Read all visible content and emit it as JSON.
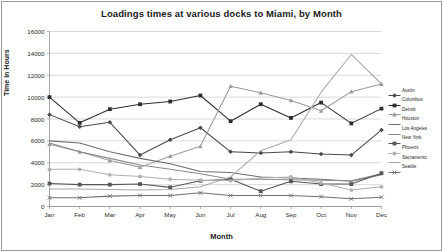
{
  "chart_data": {
    "type": "line",
    "title": "Loadings times at various docks to Miami, by Month",
    "xlabel": "Month",
    "ylabel": "Time in Hours",
    "categories": [
      "Jan",
      "Feb",
      "Mar",
      "Apr",
      "May",
      "Jun",
      "Jul",
      "Aug",
      "Sep",
      "Oct",
      "Nov",
      "Dec"
    ],
    "ylim": [
      0,
      16000
    ],
    "ytick_labels": [
      "0",
      "2000",
      "4000",
      "6000",
      "8000",
      "10000",
      "12000",
      "14000",
      "16000"
    ],
    "ytick_values": [
      0,
      2000,
      4000,
      6000,
      8000,
      10000,
      12000,
      14000,
      16000
    ],
    "grid": "horizontal",
    "legend_position": "right",
    "series": [
      {
        "name": "Austin",
        "color": "#4a4a4a",
        "marker": "diamond",
        "values": [
          8400,
          7300,
          7700,
          4700,
          6100,
          7200,
          5000,
          4900,
          5000,
          4800,
          4700,
          7000
        ]
      },
      {
        "name": "Columbus",
        "color": "#2e2e2e",
        "marker": "square",
        "values": [
          10000,
          7650,
          8900,
          9350,
          9600,
          10150,
          7800,
          9350,
          8100,
          9500,
          7600,
          8950
        ]
      },
      {
        "name": "Detroit",
        "color": "#9c9c9c",
        "marker": "triangle",
        "values": [
          5700,
          5000,
          4200,
          3600,
          4600,
          5500,
          11000,
          10400,
          9700,
          8750,
          10500,
          11200
        ]
      },
      {
        "name": "Houston",
        "color": "#6e6e6e",
        "marker": "none",
        "values": [
          6000,
          5800,
          5000,
          4400,
          3900,
          3200,
          3100,
          2700,
          2600,
          2500,
          2300,
          2900
        ]
      },
      {
        "name": "Los Angeles",
        "color": "#8a8a8a",
        "marker": "none",
        "values": [
          5800,
          5000,
          4400,
          3800,
          3400,
          3000,
          2500,
          2500,
          2450,
          2400,
          2350,
          3000
        ]
      },
      {
        "name": "New York",
        "color": "#565656",
        "marker": "square",
        "values": [
          2100,
          2000,
          2000,
          2050,
          1750,
          2350,
          2500,
          1400,
          2300,
          2050,
          2050,
          3050
        ]
      },
      {
        "name": "Phoenix",
        "color": "#b0b0b0",
        "marker": "circle",
        "values": [
          3400,
          3400,
          2900,
          2750,
          2500,
          2400,
          2350,
          2600,
          2700,
          2150,
          1500,
          1800
        ]
      },
      {
        "name": "Sacramento",
        "color": "#a8a8a8",
        "marker": "none",
        "values": [
          1600,
          1600,
          1550,
          1500,
          1550,
          1800,
          2700,
          5100,
          6100,
          10450,
          13900,
          11200
        ]
      },
      {
        "name": "Seattle",
        "color": "#707070",
        "marker": "x",
        "values": [
          800,
          800,
          950,
          1000,
          1000,
          1250,
          1000,
          1000,
          1000,
          900,
          700,
          850
        ]
      }
    ]
  }
}
